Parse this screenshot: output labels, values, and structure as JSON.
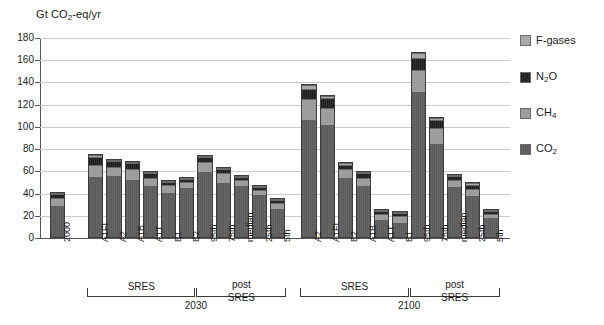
{
  "chart_data": {
    "type": "bar",
    "title": "",
    "ylabel": "Gt CO2-eq/yr",
    "xlabel": "",
    "ylim": [
      0,
      180
    ],
    "yticks": [
      0,
      20,
      40,
      60,
      80,
      100,
      120,
      140,
      160,
      180
    ],
    "grid": true,
    "stacked": true,
    "legend_position": "right",
    "legend": [
      "F-gases",
      "N2O",
      "CH4",
      "CO2"
    ],
    "series_colors": {
      "F-gases": "#a9a9a9",
      "N2O": "#222222",
      "CH4": "#9d9d9d",
      "CO2": "#5b5b5b"
    },
    "categories": [
      "2000",
      "A1FI",
      "A2",
      "A1B",
      "A1T",
      "B1",
      "B2",
      "95th",
      "75th",
      "median",
      "25th",
      "5th",
      "A2",
      "A1FI",
      "B2",
      "A1B",
      "A1T",
      "B1",
      "95th",
      "75th",
      "median",
      "25th",
      "5th"
    ],
    "series": [
      {
        "name": "CO2",
        "values": [
          31,
          59,
          56,
          53,
          47,
          42,
          46,
          60,
          50,
          47,
          39,
          27,
          107,
          102,
          55,
          47,
          16,
          14,
          132,
          85,
          46,
          38,
          18
        ]
      },
      {
        "name": "CH4",
        "values": [
          8,
          12,
          9,
          10,
          8,
          7,
          5,
          9,
          9,
          6,
          5,
          5,
          19,
          16,
          8,
          8,
          6,
          6,
          20,
          15,
          7,
          7,
          4
        ]
      },
      {
        "name": "N2O",
        "values": [
          3,
          8,
          5,
          5,
          4,
          3,
          3,
          5,
          4,
          3,
          3,
          3,
          9,
          9,
          4,
          4,
          3,
          3,
          11,
          7,
          4,
          4,
          3
        ]
      },
      {
        "name": "F-gases",
        "values": [
          0.6,
          2,
          1,
          1,
          1,
          1,
          1,
          1,
          1,
          1,
          1,
          1,
          4,
          2,
          1,
          1,
          1,
          1,
          4,
          2,
          1,
          1,
          1
        ]
      }
    ],
    "totals": [
      41,
      76,
      71,
      69,
      60,
      52,
      55,
      75,
      64,
      57,
      48,
      36,
      139,
      129,
      68,
      60,
      26,
      24,
      167,
      109,
      58,
      50,
      26
    ],
    "group_brackets": [
      {
        "label": "SRES",
        "year": "2030",
        "categories": [
          "A1FI",
          "A2",
          "A1B",
          "A1T",
          "B1",
          "B2"
        ]
      },
      {
        "label": "post SRES",
        "year": "2030",
        "categories": [
          "95th",
          "75th",
          "median",
          "25th",
          "5th"
        ]
      },
      {
        "label": "SRES",
        "year": "2100",
        "categories": [
          "A2",
          "A1FI",
          "B2",
          "A1B",
          "A1T",
          "B1"
        ]
      },
      {
        "label": "post SRES",
        "year": "2100",
        "categories": [
          "95th",
          "75th",
          "median",
          "25th",
          "5th"
        ]
      }
    ],
    "group_years": [
      "2030",
      "2100"
    ],
    "bracket_labels": {
      "sres": "SRES",
      "post": "post",
      "post2": "SRES"
    }
  }
}
